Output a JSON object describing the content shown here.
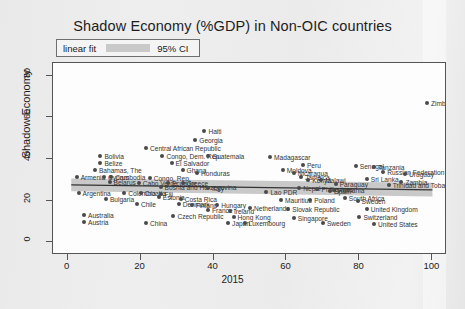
{
  "chart_data": {
    "type": "scatter",
    "title": "Shadow Economy (%GDP) in Non-OIC countries",
    "xlabel": "2015",
    "ylabel": "Shadow Economy",
    "xlim": [
      -4,
      104
    ],
    "ylim": [
      -6,
      86
    ],
    "xticks": [
      0,
      20,
      40,
      60,
      80,
      100
    ],
    "yticks": [
      0,
      20,
      40,
      60,
      80
    ],
    "grid": false,
    "legend": {
      "position": "top-left-outside",
      "entries": [
        {
          "label": "linear fit",
          "type": "line",
          "color": "#333333"
        },
        {
          "label": "95% CI",
          "type": "band",
          "color": "#c9c9c9"
        }
      ]
    },
    "fit": {
      "type": "linear",
      "x_start": 1.0,
      "y_start": 27.6,
      "x_end": 100.0,
      "y_end": 25.2,
      "ci_upper_start": 30.6,
      "ci_upper_end": 28.6,
      "ci_lower_start": 24.6,
      "ci_lower_end": 22.0,
      "line_color": "#333333",
      "band_color": "#c9c9c9"
    },
    "point_color": "#4a4a4a",
    "points": [
      {
        "label": "Zimbabwe",
        "x": 98.5,
        "y": 67.0,
        "lp": "right"
      },
      {
        "label": "Haiti",
        "x": 37.5,
        "y": 53.5,
        "lp": "right"
      },
      {
        "label": "Georgia",
        "x": 35.0,
        "y": 49.0,
        "lp": "right"
      },
      {
        "label": "Central African Republic",
        "x": 21.5,
        "y": 45.5,
        "lp": "right"
      },
      {
        "label": "Congo, Dem. Rep.",
        "x": 26.0,
        "y": 41.5,
        "lp": "right"
      },
      {
        "label": "Guatemala",
        "x": 38.5,
        "y": 41.5,
        "lp": "right"
      },
      {
        "label": "Bolivia",
        "x": 9.0,
        "y": 41.5,
        "lp": "right"
      },
      {
        "label": "Madagascar",
        "x": 55.5,
        "y": 41.0,
        "lp": "right"
      },
      {
        "label": "Belize",
        "x": 9.0,
        "y": 38.0,
        "lp": "right"
      },
      {
        "label": "El Salvador",
        "x": 28.5,
        "y": 38.0,
        "lp": "right"
      },
      {
        "label": "Peru",
        "x": 64.5,
        "y": 37.0,
        "lp": "right"
      },
      {
        "label": "Senegal",
        "x": 79.0,
        "y": 36.5,
        "lp": "right"
      },
      {
        "label": "Tanzania",
        "x": 84.0,
        "y": 36.0,
        "lp": "right"
      },
      {
        "label": "Bahamas, The",
        "x": 7.5,
        "y": 34.5,
        "lp": "right"
      },
      {
        "label": "Ghana",
        "x": 31.5,
        "y": 34.5,
        "lp": "right"
      },
      {
        "label": "Honduras",
        "x": 35.5,
        "y": 33.5,
        "lp": "right"
      },
      {
        "label": "Moldova",
        "x": 59.0,
        "y": 34.5,
        "lp": "right"
      },
      {
        "label": "Nicaragua",
        "x": 62.0,
        "y": 33.5,
        "lp": "right"
      },
      {
        "label": "Russian Federation",
        "x": 86.5,
        "y": 34.0,
        "lp": "right"
      },
      {
        "label": "Uruguay",
        "x": 92.5,
        "y": 33.0,
        "lp": "right"
      },
      {
        "label": "Armenia",
        "x": 2.5,
        "y": 31.5,
        "lp": "right"
      },
      {
        "label": "Cambodia",
        "x": 12.0,
        "y": 31.5,
        "lp": "right"
      },
      {
        "label": "Congo, Rep.",
        "x": 22.5,
        "y": 31.0,
        "lp": "right"
      },
      {
        "label": "Cyprus",
        "x": 10.0,
        "y": 31.5,
        "lp": "right"
      },
      {
        "label": "Jamaica",
        "x": 64.0,
        "y": 31.5,
        "lp": "right"
      },
      {
        "label": "Kenya",
        "x": 66.0,
        "y": 30.0,
        "lp": "right"
      },
      {
        "label": "Malawi",
        "x": 69.5,
        "y": 30.0,
        "lp": "right"
      },
      {
        "label": "Sri Lanka",
        "x": 82.0,
        "y": 30.5,
        "lp": "right"
      },
      {
        "label": "Belarus",
        "x": 11.5,
        "y": 29.0,
        "lp": "right"
      },
      {
        "label": "Cabo Verde",
        "x": 19.5,
        "y": 28.5,
        "lp": "right"
      },
      {
        "label": "Ecuador",
        "x": 27.5,
        "y": 28.5,
        "lp": "right"
      },
      {
        "label": "Greece",
        "x": 31.5,
        "y": 28.5,
        "lp": "right"
      },
      {
        "label": "Bosnia and Herzegovina",
        "x": 25.5,
        "y": 26.5,
        "lp": "right"
      },
      {
        "label": "Paraguay",
        "x": 73.5,
        "y": 28.0,
        "lp": "right"
      },
      {
        "label": "Trinidad and Tobago",
        "x": 88.0,
        "y": 27.5,
        "lp": "right"
      },
      {
        "label": "Zambia",
        "x": 91.5,
        "y": 29.0,
        "lp": "right"
      },
      {
        "label": "Italy",
        "x": 38.5,
        "y": 26.0,
        "lp": "right"
      },
      {
        "label": "Nepal",
        "x": 63.5,
        "y": 26.0,
        "lp": "right"
      },
      {
        "label": "Philippines",
        "x": 68.5,
        "y": 25.5,
        "lp": "right"
      },
      {
        "label": "Romania",
        "x": 73.0,
        "y": 25.0,
        "lp": "right"
      },
      {
        "label": "Argentina",
        "x": 3.0,
        "y": 23.5,
        "lp": "right"
      },
      {
        "label": "Colombia",
        "x": 15.5,
        "y": 23.5,
        "lp": "right"
      },
      {
        "label": "Croatia",
        "x": 20.0,
        "y": 23.5,
        "lp": "right"
      },
      {
        "label": "Fiji",
        "x": 25.5,
        "y": 23.0,
        "lp": "right"
      },
      {
        "label": "Lao PDR",
        "x": 54.5,
        "y": 24.0,
        "lp": "right"
      },
      {
        "label": "Spain",
        "x": 72.0,
        "y": 24.5,
        "lp": "right"
      },
      {
        "label": "Bulgaria",
        "x": 10.5,
        "y": 21.0,
        "lp": "right"
      },
      {
        "label": "Estonia",
        "x": 25.0,
        "y": 22.0,
        "lp": "right"
      },
      {
        "label": "Costa Rica",
        "x": 31.0,
        "y": 21.0,
        "lp": "right"
      },
      {
        "label": "Mauritius",
        "x": 58.5,
        "y": 20.5,
        "lp": "right"
      },
      {
        "label": "South Africa",
        "x": 76.0,
        "y": 21.5,
        "lp": "right"
      },
      {
        "label": "Poland",
        "x": 66.5,
        "y": 20.5,
        "lp": "right"
      },
      {
        "label": "Sweden",
        "x": 79.5,
        "y": 20.0,
        "lp": "right"
      },
      {
        "label": "Chile",
        "x": 19.0,
        "y": 18.5,
        "lp": "right"
      },
      {
        "label": "Denmark",
        "x": 30.5,
        "y": 18.5,
        "lp": "right"
      },
      {
        "label": "Finland",
        "x": 34.0,
        "y": 18.0,
        "lp": "right"
      },
      {
        "label": "Hungary",
        "x": 41.0,
        "y": 18.0,
        "lp": "right"
      },
      {
        "label": "Netherlands",
        "x": 50.0,
        "y": 16.5,
        "lp": "right"
      },
      {
        "label": "Slovak Republic",
        "x": 60.5,
        "y": 16.0,
        "lp": "right"
      },
      {
        "label": "United Kingdom",
        "x": 82.0,
        "y": 16.0,
        "lp": "right"
      },
      {
        "label": "France",
        "x": 38.5,
        "y": 15.5,
        "lp": "right"
      },
      {
        "label": "Ireland",
        "x": 44.5,
        "y": 15.0,
        "lp": "right"
      },
      {
        "label": "Australia",
        "x": 4.5,
        "y": 13.0,
        "lp": "right"
      },
      {
        "label": "Czech Republic",
        "x": 29.0,
        "y": 12.5,
        "lp": "right"
      },
      {
        "label": "Hong Kong",
        "x": 45.5,
        "y": 12.0,
        "lp": "right"
      },
      {
        "label": "Singapore",
        "x": 62.0,
        "y": 11.5,
        "lp": "right"
      },
      {
        "label": "Switzerland",
        "x": 80.0,
        "y": 12.0,
        "lp": "right"
      },
      {
        "label": "Austria",
        "x": 4.5,
        "y": 10.0,
        "lp": "right"
      },
      {
        "label": "China",
        "x": 21.5,
        "y": 9.5,
        "lp": "right"
      },
      {
        "label": "Japan",
        "x": 44.0,
        "y": 9.5,
        "lp": "right"
      },
      {
        "label": "Luxembourg",
        "x": 48.5,
        "y": 9.5,
        "lp": "right"
      },
      {
        "label": "Sweden",
        "x": 70.0,
        "y": 9.5,
        "lp": "right"
      },
      {
        "label": "United States",
        "x": 84.0,
        "y": 9.0,
        "lp": "right"
      }
    ]
  }
}
